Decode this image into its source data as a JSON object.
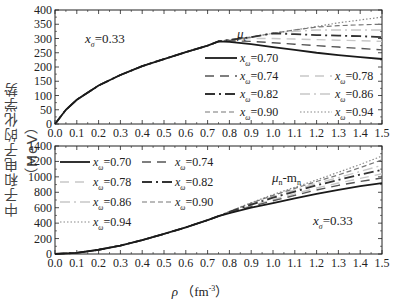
{
  "ylabel": "中子和电子的化学势（MeV）",
  "xlabel": "ρ （fm⁻³）",
  "chart_data": [
    {
      "type": "line",
      "title": "μe",
      "annotation": "xσ=0.33",
      "xlabel": "ρ (fm^-3)",
      "ylabel": "中子和电子的化学势（MeV）",
      "xlim": [
        0.0,
        1.5
      ],
      "ylim": [
        0,
        400
      ],
      "xticks": [
        0.0,
        0.1,
        0.2,
        0.3,
        0.4,
        0.5,
        0.6,
        0.7,
        0.8,
        0.9,
        1.0,
        1.1,
        1.2,
        1.3,
        1.4,
        1.5
      ],
      "yticks": [
        0,
        50,
        100,
        150,
        200,
        250,
        300,
        350,
        400
      ],
      "x": [
        0.0,
        0.05,
        0.1,
        0.2,
        0.3,
        0.4,
        0.5,
        0.6,
        0.7,
        0.75,
        0.8,
        0.9,
        1.0,
        1.1,
        1.2,
        1.3,
        1.4,
        1.5
      ],
      "series": [
        {
          "name": "xω=0.70",
          "style": "solid",
          "values": [
            0,
            50,
            85,
            135,
            172,
            203,
            228,
            252,
            275,
            290,
            288,
            280,
            270,
            260,
            250,
            242,
            235,
            228
          ]
        },
        {
          "name": "xω=0.74",
          "style": "dashed",
          "values": [
            0,
            50,
            85,
            135,
            172,
            203,
            228,
            252,
            275,
            290,
            292,
            290,
            285,
            280,
            275,
            270,
            265,
            260
          ]
        },
        {
          "name": "xω=0.78",
          "style": "light-dashed",
          "values": [
            0,
            50,
            85,
            135,
            172,
            203,
            228,
            252,
            275,
            290,
            295,
            300,
            300,
            298,
            296,
            294,
            292,
            290
          ]
        },
        {
          "name": "xω=0.82",
          "style": "dash-dot",
          "values": [
            0,
            50,
            85,
            135,
            172,
            203,
            228,
            252,
            275,
            290,
            295,
            305,
            318,
            315,
            312,
            310,
            308,
            305
          ]
        },
        {
          "name": "xω=0.86",
          "style": "light-dash-dot",
          "values": [
            0,
            50,
            85,
            135,
            172,
            203,
            228,
            252,
            275,
            290,
            295,
            305,
            318,
            325,
            330,
            330,
            330,
            330
          ]
        },
        {
          "name": "xω=0.90",
          "style": "short-dashed",
          "values": [
            0,
            50,
            85,
            135,
            172,
            203,
            228,
            252,
            275,
            290,
            295,
            305,
            318,
            330,
            340,
            345,
            348,
            350
          ]
        },
        {
          "name": "xω=0.94",
          "style": "dotted",
          "values": [
            0,
            50,
            85,
            135,
            172,
            203,
            228,
            252,
            275,
            290,
            295,
            305,
            318,
            330,
            342,
            355,
            365,
            375
          ]
        }
      ]
    },
    {
      "type": "line",
      "title": "μn-mn",
      "annotation": "xσ=0.33",
      "xlabel": "ρ (fm^-3)",
      "ylabel": "中子和电子的化学势（MeV）",
      "xlim": [
        0.0,
        1.5
      ],
      "ylim": [
        0,
        1400
      ],
      "xticks": [
        0.0,
        0.1,
        0.2,
        0.3,
        0.4,
        0.5,
        0.6,
        0.7,
        0.8,
        0.9,
        1.0,
        1.1,
        1.2,
        1.3,
        1.4,
        1.5
      ],
      "yticks": [
        0,
        200,
        400,
        600,
        800,
        1000,
        1200,
        1400
      ],
      "x": [
        0.0,
        0.1,
        0.2,
        0.3,
        0.4,
        0.5,
        0.6,
        0.7,
        0.75,
        0.8,
        0.9,
        1.0,
        1.1,
        1.2,
        1.3,
        1.4,
        1.5
      ],
      "series": [
        {
          "name": "xω=0.70",
          "style": "solid",
          "values": [
            0,
            15,
            55,
            110,
            180,
            260,
            345,
            440,
            490,
            530,
            600,
            660,
            720,
            780,
            830,
            880,
            920
          ]
        },
        {
          "name": "xω=0.74",
          "style": "dashed",
          "values": [
            0,
            15,
            55,
            110,
            180,
            260,
            345,
            440,
            490,
            535,
            615,
            690,
            760,
            830,
            890,
            940,
            985
          ]
        },
        {
          "name": "xω=0.78",
          "style": "light-dashed",
          "values": [
            0,
            15,
            55,
            110,
            180,
            260,
            345,
            440,
            490,
            540,
            625,
            705,
            780,
            855,
            920,
            980,
            1040
          ]
        },
        {
          "name": "xω=0.82",
          "style": "dash-dot",
          "values": [
            0,
            15,
            55,
            110,
            180,
            260,
            345,
            440,
            490,
            545,
            640,
            730,
            810,
            890,
            960,
            1030,
            1090
          ]
        },
        {
          "name": "xω=0.86",
          "style": "light-dash-dot",
          "values": [
            0,
            15,
            55,
            110,
            180,
            260,
            345,
            440,
            490,
            548,
            650,
            745,
            830,
            915,
            990,
            1070,
            1150
          ]
        },
        {
          "name": "xω=0.90",
          "style": "short-dashed",
          "values": [
            0,
            15,
            55,
            110,
            180,
            260,
            345,
            440,
            490,
            550,
            660,
            760,
            850,
            940,
            1025,
            1120,
            1220
          ]
        },
        {
          "name": "xω=0.94",
          "style": "dotted",
          "values": [
            0,
            15,
            55,
            110,
            180,
            260,
            345,
            440,
            490,
            552,
            665,
            770,
            865,
            960,
            1060,
            1160,
            1270
          ]
        }
      ]
    }
  ],
  "legend_top": [
    {
      "label": "xω=0.70"
    },
    {
      "label": "xω=0.74"
    },
    {
      "label": "xω=0.78"
    },
    {
      "label": "xω=0.82"
    },
    {
      "label": "xω=0.86"
    },
    {
      "label": "xω=0.90"
    },
    {
      "label": "xω=0.94"
    }
  ],
  "styles": {
    "solid": {
      "color": "#1a1a1a",
      "dash": "",
      "width": 1.8
    },
    "dashed": {
      "color": "#555555",
      "dash": "9,6",
      "width": 1.4
    },
    "light-dashed": {
      "color": "#c8c8c8",
      "dash": "9,6",
      "width": 1.4
    },
    "dash-dot": {
      "color": "#333333",
      "dash": "10,4,2,4",
      "width": 1.8
    },
    "light-dash-dot": {
      "color": "#c8c8c8",
      "dash": "10,4,2,4",
      "width": 1.4
    },
    "short-dashed": {
      "color": "#777777",
      "dash": "5,3",
      "width": 1.2
    },
    "dotted": {
      "color": "#888888",
      "dash": "1.5,2",
      "width": 1.2
    }
  }
}
